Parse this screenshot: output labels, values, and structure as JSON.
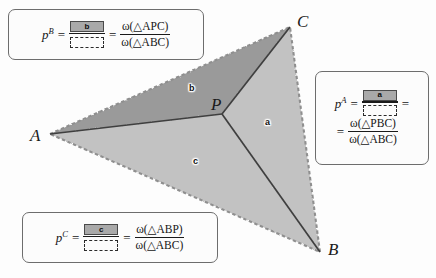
{
  "diagram": {
    "vertices": [
      {
        "name": "A",
        "label": "A",
        "x": 50,
        "y": 134
      },
      {
        "name": "B",
        "label": "B",
        "x": 320,
        "y": 252
      },
      {
        "name": "C",
        "label": "C",
        "x": 290,
        "y": 27
      },
      {
        "name": "P",
        "label": "P",
        "x": 222,
        "y": 114
      }
    ],
    "regions": [
      {
        "name": "a",
        "label": "a",
        "x": 268,
        "y": 122,
        "color": "#c2c2c2"
      },
      {
        "name": "b",
        "label": "b",
        "x": 192,
        "y": 88,
        "color": "#9a9a9a"
      },
      {
        "name": "c",
        "label": "c",
        "x": 196,
        "y": 161,
        "color": "#c2c2c2"
      }
    ],
    "colors": {
      "region_dark": "#9a9a9a",
      "region_light": "#c2c2c2",
      "edge_line": "#4a4a4a",
      "outline_dash": "#8c8c8c",
      "background": "#fdfdfd"
    }
  },
  "boxes": {
    "pB": {
      "symbol": "p",
      "superscript": "B",
      "equals": "=",
      "numerator_label": "b",
      "denominator_label": "",
      "equals2": "=",
      "omega_numerator": "ω(△APC)",
      "omega_denominator": "ω(△ABC)"
    },
    "pA": {
      "symbol": "p",
      "superscript": "A",
      "equals": "=",
      "numerator_label": "a",
      "denominator_label": "",
      "equals2": "=",
      "equals3": "=",
      "omega_numerator": "ω(△PBC)",
      "omega_denominator": "ω(△ABC)"
    },
    "pC": {
      "symbol": "p",
      "superscript": "C",
      "equals": "=",
      "numerator_label": "c",
      "denominator_label": "",
      "equals2": "=",
      "omega_numerator": "ω(△ABP)",
      "omega_denominator": "ω(△ABC)"
    }
  }
}
